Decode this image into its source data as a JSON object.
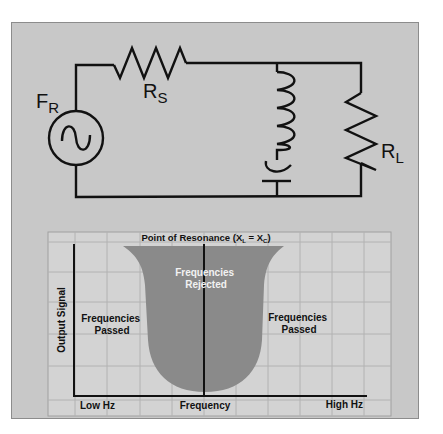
{
  "circuit": {
    "source_label": "F",
    "source_subscript": "R",
    "series_resistor_label": "R",
    "series_resistor_subscript": "S",
    "load_resistor_label": "R",
    "load_resistor_subscript": "L",
    "components": [
      "ac-source",
      "series-resistor",
      "inductor",
      "capacitor",
      "load-resistor"
    ]
  },
  "chart": {
    "title_prefix": "Point of Resonance (X",
    "title_sub_l": "L",
    "title_mid": " = X",
    "title_sub_c": "C",
    "title_suffix": ")",
    "rejected_line1": "Frequencies",
    "rejected_line2": "Rejected",
    "passed_left_line1": "Frequencies",
    "passed_left_line2": "Passed",
    "passed_right_line1": "Frequencies",
    "passed_right_line2": "Passed",
    "y_axis_label": "Output Signal",
    "x_axis_left": "Low Hz",
    "x_axis_center": "Frequency",
    "x_axis_right": "High Hz"
  },
  "colors": {
    "panel": "#c8c8c8",
    "chart_bg": "#d3d3d3",
    "grid": "#b2b2b2",
    "notch_fill": "#8a8a8a",
    "line": "#111111",
    "rejected_text": "#f2f2f2"
  }
}
